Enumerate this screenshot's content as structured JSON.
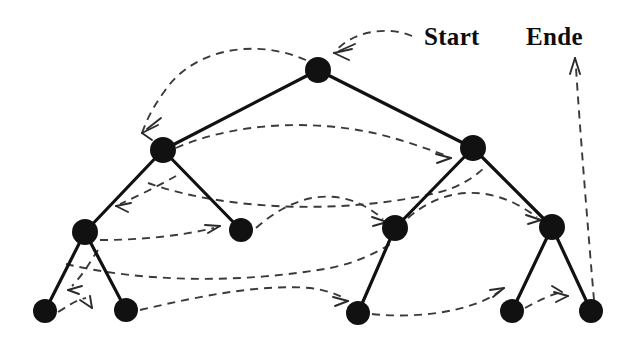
{
  "figure": {
    "name": "binary-tree-depth-first-traversal",
    "background_color": "#ffffff",
    "width": 633,
    "height": 344,
    "node_color": "#111111",
    "edge_color": "#111111",
    "traversal_color": "#3a3a3a"
  },
  "labels": {
    "start": "Start",
    "ende": "Ende"
  },
  "chart_data": {
    "type": "diagram",
    "title": "",
    "nodes": [
      {
        "id": "root",
        "label": "",
        "x": 318,
        "y": 70,
        "r": 13,
        "level": 0
      },
      {
        "id": "L",
        "label": "",
        "x": 163,
        "y": 150,
        "r": 13,
        "level": 1
      },
      {
        "id": "R",
        "label": "",
        "x": 473,
        "y": 148,
        "r": 13,
        "level": 1
      },
      {
        "id": "LL",
        "label": "",
        "x": 85,
        "y": 232,
        "r": 13,
        "level": 2
      },
      {
        "id": "LR",
        "label": "",
        "x": 241,
        "y": 230,
        "r": 12,
        "level": 2
      },
      {
        "id": "RL",
        "label": "",
        "x": 395,
        "y": 228,
        "r": 13,
        "level": 2
      },
      {
        "id": "RR",
        "label": "",
        "x": 552,
        "y": 227,
        "r": 13,
        "level": 2
      },
      {
        "id": "LLL",
        "label": "",
        "x": 45,
        "y": 311,
        "r": 12,
        "level": 3
      },
      {
        "id": "LLR",
        "label": "",
        "x": 126,
        "y": 310,
        "r": 12,
        "level": 3
      },
      {
        "id": "RLL",
        "label": "",
        "x": 358,
        "y": 313,
        "r": 12,
        "level": 3
      },
      {
        "id": "RRL",
        "label": "",
        "x": 512,
        "y": 311,
        "r": 12,
        "level": 3
      },
      {
        "id": "RRR",
        "label": "",
        "x": 591,
        "y": 311,
        "r": 12,
        "level": 3
      }
    ],
    "edges": [
      {
        "from": "root",
        "to": "L"
      },
      {
        "from": "root",
        "to": "R"
      },
      {
        "from": "L",
        "to": "LL"
      },
      {
        "from": "L",
        "to": "LR"
      },
      {
        "from": "R",
        "to": "RL"
      },
      {
        "from": "R",
        "to": "RR"
      },
      {
        "from": "LL",
        "to": "LLL"
      },
      {
        "from": "LL",
        "to": "LLR"
      },
      {
        "from": "RL",
        "to": "RLL"
      },
      {
        "from": "RR",
        "to": "RRL"
      },
      {
        "from": "RR",
        "to": "RRR"
      }
    ],
    "traversal_order": [
      "Start",
      "root",
      "L",
      "LL",
      "LLL",
      "LLR",
      "LL",
      "L",
      "LR",
      "L",
      "root",
      "R",
      "RL",
      "RLL",
      "RL",
      "R",
      "RR",
      "RRL",
      "RRR",
      "Ende"
    ],
    "traversal_segments": [
      {
        "id": "seg-start-root",
        "from": "Start",
        "to": "root",
        "arrow": true
      },
      {
        "id": "seg-root-L",
        "from": "root",
        "to": "L",
        "arrow": true
      },
      {
        "id": "seg-L-LL",
        "from": "L",
        "to": "LL",
        "arrow": true
      },
      {
        "id": "seg-LL-LLL",
        "from": "LL",
        "to": "LLL",
        "arrow": true
      },
      {
        "id": "seg-LLL-LLR",
        "from": "LLL",
        "to": "LLR",
        "arrow": true
      },
      {
        "id": "seg-LLR-LR",
        "from": "LLR",
        "to": "LR",
        "arrow": true
      },
      {
        "id": "seg-LR-RL",
        "from": "LR",
        "to": "RL",
        "arrow": true
      },
      {
        "id": "seg-LL-R",
        "from": "LL",
        "to": "R",
        "arrow": true
      },
      {
        "id": "seg-L-R",
        "from": "L",
        "to": "R",
        "arrow": true
      },
      {
        "id": "seg-RL-RR",
        "from": "RL",
        "to": "RR",
        "arrow": true
      },
      {
        "id": "seg-RLL-RRL",
        "from": "RLL",
        "to": "RRL",
        "arrow": true
      },
      {
        "id": "seg-RRL-RRR",
        "from": "RRL",
        "to": "RRR",
        "arrow": true
      },
      {
        "id": "seg-RRR-Ende",
        "from": "RRR",
        "to": "Ende",
        "arrow": true
      }
    ],
    "legend": [],
    "grid": false
  },
  "label_positions": {
    "start": {
      "x": 424,
      "y": 45
    },
    "ende": {
      "x": 526,
      "y": 45
    }
  }
}
